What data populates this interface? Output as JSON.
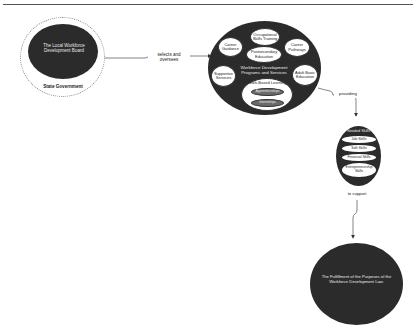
{
  "diagram": {
    "board": {
      "label": "The Local Workforce Development Board",
      "container_label": "State Government"
    },
    "edges": {
      "selects": "selects and oversees",
      "providing": "providing",
      "support": "to support"
    },
    "programs": {
      "title": "Workforce Development Programs and Services",
      "items": [
        "Career Guidance",
        "Occupational Skills Training",
        "Postsecondary Education",
        "Career Pathways",
        "Supportive Services",
        "Adult Basic Education"
      ],
      "work_based": {
        "label": "Work-Based Learning",
        "sub_items": [
          "Apprenticeships",
          "Internships"
        ]
      }
    },
    "skills": {
      "title": "Needed Skills",
      "items": [
        "Job Skills",
        "Soft Skills",
        "Financial Skills",
        "Entrepreneurship Skills"
      ]
    },
    "outcome": {
      "label": "The Fulfillment of the Purposes of the Workforce Development Law."
    },
    "colors": {
      "dark_fill": "#2b2b2b",
      "light_fill": "#ffffff",
      "sub_fill": "#6a6a6a",
      "line": "#555555"
    }
  }
}
